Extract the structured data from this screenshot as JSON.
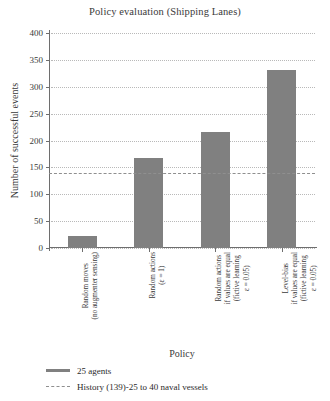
{
  "chart_data": {
    "type": "bar",
    "title": "Policy evaluation (Shipping Lanes)",
    "xlabel": "Policy",
    "ylabel": "Number of successful events",
    "ylim": [
      0,
      400
    ],
    "ytick_step": 50,
    "yticks": [
      0,
      50,
      100,
      150,
      200,
      250,
      300,
      350,
      400
    ],
    "grid": true,
    "legend_position": "bottom-left",
    "bar_color": "#808080",
    "reference_line_color": "#8f8f8f",
    "categories": [
      "Random moves\n(no augmenter sensing)",
      "Random actions\n(ε = 1)",
      "Random actions\nif values are equal\n(fictive learning\nε = 0.05)",
      "Level-bias\nif values are equal\n(fictive learning\nε = 0.05)"
    ],
    "series": [
      {
        "name": "25 agents",
        "values": [
          22,
          168,
          216,
          332
        ]
      }
    ],
    "reference_lines": [
      {
        "name": "History (139)-25 to 40 naval vessels",
        "value": 139,
        "style": "dashed"
      }
    ],
    "legend": [
      {
        "label": "25 agents",
        "style": "solid"
      },
      {
        "label": "History (139)-25 to 40 naval vessels",
        "style": "dashed"
      }
    ]
  }
}
